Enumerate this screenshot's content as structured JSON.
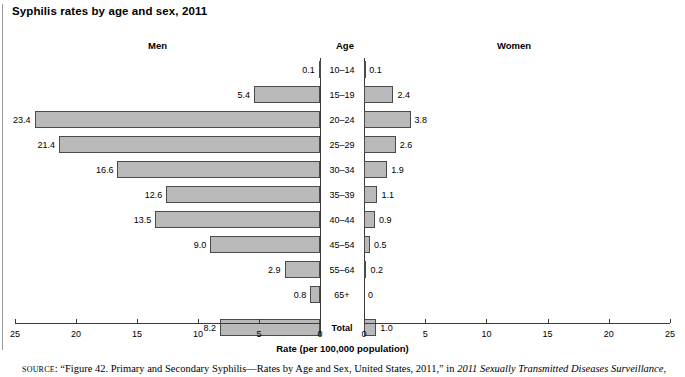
{
  "title": "Syphilis rates by age and sex, 2011",
  "headers": {
    "men": "Men",
    "age": "Age",
    "women": "Women"
  },
  "axis": {
    "title": "Rate (per 100,000 population)",
    "left_ticks": [
      "25",
      "20",
      "15",
      "10",
      "5",
      "0"
    ],
    "right_ticks": [
      "0",
      "5",
      "10",
      "15",
      "20",
      "25"
    ],
    "max": 25,
    "min": 0
  },
  "source": {
    "label": "SOURCE",
    "text": ": “Figure 42. Primary and Secondary Syphilis—Rates by Age and Sex, United States, 2011,” in ",
    "italic": "2011 Sexually Transmitted Diseases Surveillance,",
    "tail": ""
  },
  "colors": {
    "bar_fill": "#b9b9b9",
    "bar_stroke": "#4a4a4a",
    "axis": "#3a3a3a",
    "text": "#000000"
  },
  "chart_data": {
    "type": "bar",
    "orientation": "horizontal-pyramid",
    "title": "Syphilis rates by age and sex, 2011",
    "xlabel": "Rate (per 100,000 population)",
    "ylabel": "Age",
    "xlim": [
      0,
      25
    ],
    "grid": false,
    "legend": "none",
    "categories": [
      "10–14",
      "15–19",
      "20–24",
      "25–29",
      "30–34",
      "35–39",
      "40–44",
      "45–54",
      "55–64",
      "65+",
      "Total"
    ],
    "series": [
      {
        "name": "Men",
        "side": "left",
        "values": [
          0.1,
          5.4,
          23.4,
          21.4,
          16.6,
          12.6,
          13.5,
          9.0,
          2.9,
          0.8,
          8.2
        ],
        "labels": [
          "0.1",
          "5.4",
          "23.4",
          "21.4",
          "16.6",
          "12.6",
          "13.5",
          "9.0",
          "2.9",
          "0.8",
          "8.2"
        ]
      },
      {
        "name": "Women",
        "side": "right",
        "values": [
          0.1,
          2.4,
          3.8,
          2.6,
          1.9,
          1.1,
          0.9,
          0.5,
          0.2,
          0,
          1.0
        ],
        "labels": [
          "0.1",
          "2.4",
          "3.8",
          "2.6",
          "1.9",
          "1.1",
          "0.9",
          "0.5",
          "0.2",
          "0",
          "1.0"
        ]
      }
    ]
  }
}
